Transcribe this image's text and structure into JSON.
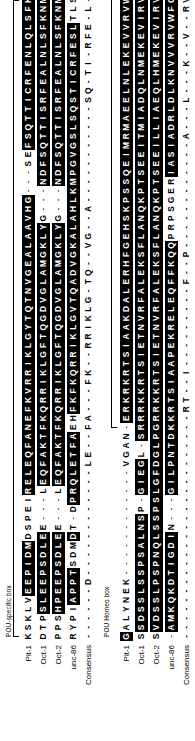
{
  "figure": {
    "type": "multiple-sequence-alignment",
    "orientation": "rotated-90-ccw",
    "row_labels": [
      "Pit-1",
      "Oct-1",
      "Oct-2",
      "unc-86",
      "Consensus"
    ],
    "highlight_color": "#000000",
    "highlight_text_color": "#ffffff",
    "background_color": "#ffffff",
    "text_color": "#000000"
  },
  "blocks": [
    {
      "id": "block-1",
      "label": "POU-specific box",
      "bracket_start_col": 0,
      "bracket_end_col": 69,
      "rows": [
        {
          "label": "Pit-1",
          "sequence": "KSKLVEEPIDMDSPEIRELEQFANEFKVRRIKLGYTQTNVGEALAAVHG---SEFSQTTICRFENLQLSFKNACKLKAILSKWLEEEQV",
          "highlight": "00000111111000001111111111111111111111111111111111000011111111111111111111111111111111111"
        },
        {
          "label": "Oct-1",
          "sequence": "DTPSLEEPSDLEE---LEQFAKTFKQRRIKLGFTQGDVGLAMGKLYG---NDFSQTTISRFEALNLSFKNMCKLKPLLEKWLNDAENL",
          "highlight": "00011111111100000111111111111111111111111111110000111111111111111111111111111111111111111"
        },
        {
          "label": "Oct-2",
          "sequence": "PPSHPEEPSDLEE---LEQFAKTFKQRRIKLGFTQGDVGLAMGKLYG---NDFSQTTISRFEALNLSFKNMCKLKPLLEKWLNDAETM",
          "highlight": "00011111111100000111111111111111111111111111110000111111111111111111111111111111111111111"
        },
        {
          "label": "unc-86",
          "sequence": "RYPIAPPTSDMDT-DPRQLETFAEHFKFKQRRIKLGVTQADVGKALAHLKMPGVGSLSQSTICRFESLTLSHNNMVALKPILHSWLEKAE-",
          "highlight": "000011110001000111111110011111111111111111111111111111111111111111110000000000000000000000"
        },
        {
          "label": "Consensus",
          "sequence": "------D------------LE--FA---FK--RRIKLG-TQ--VG--A-----------SQ-TI-RFE-L--LS--N---LK--L--WL--AE--",
          "highlight": "0000000000000000000000000000000000000000000000000000000000000000000000000000000000000000000"
        }
      ]
    },
    {
      "id": "block-2",
      "label": "POU Homeo box",
      "bracket_start_col": 23,
      "bracket_end_col": 84,
      "rows": [
        {
          "label": "Pit-1",
          "sequence": "GALYNEK------------VGAN-ERKRKRTSIAAKDALERHFGEHSKPSSQEIMRMAEELNLEKEVVRVWFCNRRQREKRVKTSLNQS",
          "highlight": "10000000000000000000000011111111111111111111111111111111111111111111111111111111110000000"
        },
        {
          "label": "Oct-1",
          "sequence": "SSDSSLSSPSALNSP-GIEGL-SRRRKKRTSIETNVRFALEKSFLANQKPTSEEITMIADQLNMEKEVIRVWFCNRRQKEKRINPSSGG",
          "highlight": "01111111111111001111011111111111111111111111111111111111111111111111111111111111111110000"
        },
        {
          "label": "Oct-2",
          "sequence": "SVDSSLPSPNQLSSPSLGFDGLPGRRKKRTSIETNVRFALEKSFLANQKPTSEEILLIAEQLHMEKEVIRVWFCNRRQKEKRINPCSAAP",
          "highlight": "01111111111111111111111111111111111111111111111111111111111111111111111111111111111100000"
        },
        {
          "label": "unc-86",
          "sequence": "-AMKQKDTIGDIN---GILPNTDKKRTSIAAPEKRELEQFFKQQPRPSGERIASIADRLDLKNVVVRVWFCNQRQKQKADFRSQFRA",
          "highlight": "011111111111000011111111111111111111111111110000000111111111111111111111111111111110000"
        },
        {
          "label": "Consensus",
          "sequence": "-------------------------RT--I---------F--P------------A---L---K--V--RVWFCN-RQ--KR-----",
          "highlight": "000000000000000000000000000000000000000000000000000000000000000000000000000000000000000"
        }
      ]
    }
  ]
}
